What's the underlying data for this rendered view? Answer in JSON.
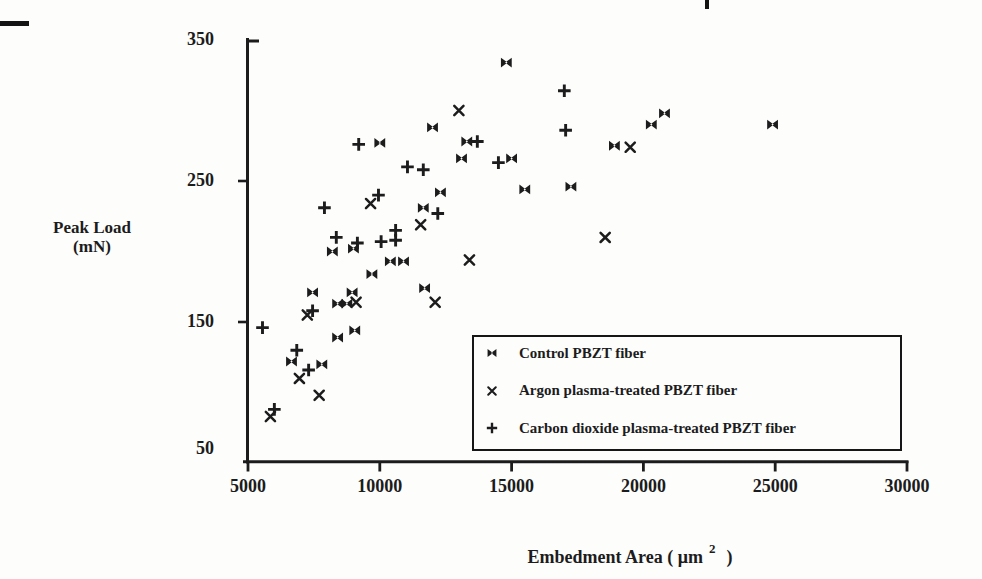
{
  "figure": {
    "ink_color": "#1c1c1c",
    "background_color": "#fdfdfc",
    "y_axis": {
      "title_line1": "Peak Load",
      "title_line2": "(mN)",
      "ticks": [
        350,
        250,
        150,
        50
      ],
      "tick_labels": [
        "350",
        "250",
        "150",
        "50"
      ]
    },
    "x_axis": {
      "title_text": "Embedment Area ( μm",
      "title_superscript": "2",
      "title_close": ")",
      "ticks": [
        5000,
        10000,
        15000,
        20000,
        25000,
        30000
      ],
      "tick_labels": [
        "5000",
        "10000",
        "15000",
        "20000",
        "25000",
        "30000"
      ]
    },
    "legend": {
      "items": [
        {
          "marker": "filled-bowtie",
          "label": "Control PBZT fiber"
        },
        {
          "marker": "x",
          "label": "Argon plasma-treated PBZT fiber"
        },
        {
          "marker": "plus",
          "label": "Carbon dioxide plasma-treated PBZT fiber"
        }
      ]
    }
  },
  "chart_data": {
    "type": "scatter",
    "title": "",
    "xlabel": "Embedment Area (μm²)",
    "ylabel": "Peak Load (mN)",
    "xlim": [
      5000,
      30000
    ],
    "ylim": [
      50,
      350
    ],
    "x_ticks": [
      5000,
      10000,
      15000,
      20000,
      25000,
      30000
    ],
    "y_ticks": [
      50,
      150,
      250,
      350
    ],
    "grid": false,
    "legend_position": "lower-right boxed",
    "series": [
      {
        "name": "Control PBZT fiber",
        "marker": "filled-bowtie",
        "points": [
          [
            14800,
            334
          ],
          [
            24900,
            290
          ],
          [
            20800,
            298
          ],
          [
            20300,
            290
          ],
          [
            18900,
            275
          ],
          [
            12000,
            288
          ],
          [
            13300,
            278
          ],
          [
            13100,
            266
          ],
          [
            15000,
            266
          ],
          [
            10000,
            277
          ],
          [
            12300,
            242
          ],
          [
            15500,
            244
          ],
          [
            17250,
            246
          ],
          [
            11650,
            231
          ],
          [
            11700,
            174
          ],
          [
            8200,
            200
          ],
          [
            9000,
            202
          ],
          [
            10400,
            193
          ],
          [
            10900,
            193
          ],
          [
            9700,
            184
          ],
          [
            7450,
            171
          ],
          [
            8950,
            171
          ],
          [
            8400,
            163
          ],
          [
            8750,
            163
          ],
          [
            8400,
            139
          ],
          [
            9050,
            144
          ],
          [
            6650,
            122
          ],
          [
            7800,
            120
          ]
        ]
      },
      {
        "name": "Argon plasma-treated PBZT fiber",
        "marker": "x",
        "points": [
          [
            13000,
            300
          ],
          [
            19500,
            274
          ],
          [
            9650,
            234
          ],
          [
            11550,
            219
          ],
          [
            13400,
            194
          ],
          [
            12100,
            164
          ],
          [
            18550,
            210
          ],
          [
            9100,
            164
          ],
          [
            7250,
            155
          ],
          [
            6950,
            110
          ],
          [
            7700,
            98
          ],
          [
            5850,
            83
          ]
        ]
      },
      {
        "name": "Carbon dioxide plasma-treated PBZT fiber",
        "marker": "plus",
        "points": [
          [
            17000,
            314
          ],
          [
            17050,
            286
          ],
          [
            13700,
            278
          ],
          [
            9200,
            276
          ],
          [
            14500,
            263
          ],
          [
            11050,
            260
          ],
          [
            11650,
            258
          ],
          [
            9950,
            240
          ],
          [
            7900,
            231
          ],
          [
            12200,
            227
          ],
          [
            10600,
            215
          ],
          [
            10600,
            208
          ],
          [
            10050,
            207
          ],
          [
            9150,
            206
          ],
          [
            8350,
            210
          ],
          [
            7450,
            158
          ],
          [
            5550,
            146
          ],
          [
            6850,
            130
          ],
          [
            7300,
            116
          ],
          [
            6000,
            88
          ]
        ]
      }
    ]
  }
}
